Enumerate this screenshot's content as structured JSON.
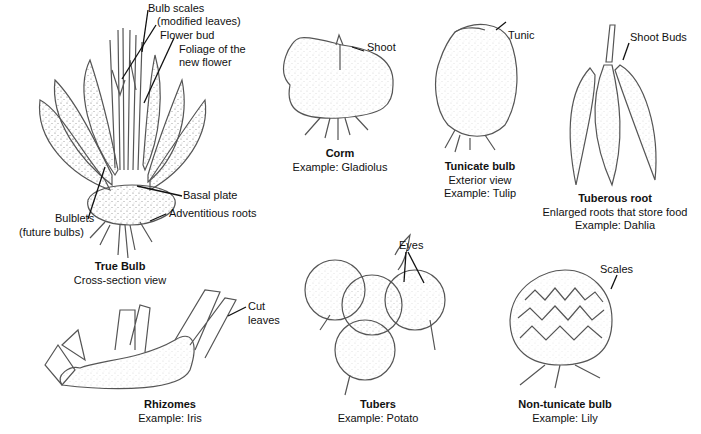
{
  "diagram": {
    "type": "labeled botanical illustration",
    "specimens": {
      "true_bulb": {
        "title": "True Bulb",
        "subtitle": "Cross-section view",
        "labels": {
          "bulb_scales_1": "Bulb scales",
          "bulb_scales_2": "(modified leaves)",
          "flower_bud": "Flower bud",
          "foliage_1": "Foliage of the",
          "foliage_2": "new flower",
          "basal_plate": "Basal plate",
          "adventitious_roots": "Adventitious roots",
          "bulblets_1": "Bulblets",
          "bulblets_2": "(future bulbs)"
        }
      },
      "corm": {
        "title": "Corm",
        "example": "Example: Gladiolus",
        "labels": {
          "shoot": "Shoot"
        }
      },
      "tunicate_bulb": {
        "title": "Tunicate bulb",
        "subtitle": "Exterior view",
        "example": "Example: Tulip",
        "labels": {
          "tunic": "Tunic"
        }
      },
      "tuberous_root": {
        "title": "Tuberous root",
        "subtitle": "Enlarged roots that store food",
        "example": "Example: Dahlia",
        "labels": {
          "shoot_buds": "Shoot Buds"
        }
      },
      "rhizomes": {
        "title": "Rhizomes",
        "example": "Example: Iris",
        "labels": {
          "cut_1": "Cut",
          "cut_2": "leaves"
        }
      },
      "tubers": {
        "title": "Tubers",
        "example": "Example: Potato",
        "labels": {
          "eyes": "Eyes"
        }
      },
      "non_tunicate_bulb": {
        "title": "Non-tunicate bulb",
        "example": "Example: Lily",
        "labels": {
          "scales": "Scales"
        }
      }
    },
    "colors": {
      "line": "#555555",
      "leader": "#111111",
      "stipple": "#777777",
      "background": "#ffffff"
    }
  }
}
